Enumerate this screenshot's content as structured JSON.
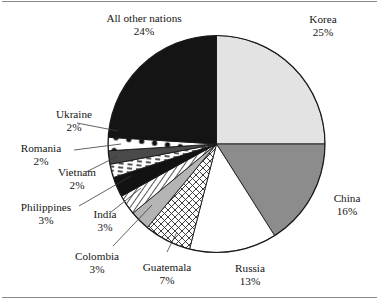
{
  "figure": {
    "name": "pie-chart-immigration-by-country",
    "background": "#ffffff",
    "frame_color": "#8a8a8a",
    "text_color": "#151515"
  },
  "chart_data": {
    "type": "pie",
    "title": "",
    "subtitle": "",
    "xlabel": "",
    "ylabel": "",
    "legend_position": "none",
    "grid": false,
    "total_percent": 100,
    "start_angle_deg": 0,
    "direction": "clockwise",
    "categories": [
      "Korea",
      "China",
      "Russia",
      "Guatemala",
      "Colombia",
      "India",
      "Philippines",
      "Vietnam",
      "Romania",
      "Ukraine",
      "All other nations"
    ],
    "values": [
      25,
      16,
      13,
      7,
      3,
      3,
      3,
      2,
      2,
      2,
      24
    ],
    "labels": [
      "Korea 25%",
      "China 16%",
      "Russia 13%",
      "Guatemala 7%",
      "Colombia 3%",
      "India 3%",
      "Philippines 3%",
      "Vietnam 2%",
      "Romania 2%",
      "Ukraine 2%",
      "All other nations 24%"
    ],
    "slices": [
      {
        "name": "Korea",
        "percent": 25,
        "label": "Korea",
        "percent_text": "25%",
        "fill": "#e3e3e3",
        "pattern": "solid-light-gray"
      },
      {
        "name": "China",
        "percent": 16,
        "label": "China",
        "percent_text": "16%",
        "fill": "#8c8c8c",
        "pattern": "solid-medium-gray"
      },
      {
        "name": "Russia",
        "percent": 13,
        "label": "Russia",
        "percent_text": "13%",
        "fill": "#ffffff",
        "pattern": "solid-white"
      },
      {
        "name": "Guatemala",
        "percent": 7,
        "label": "Guatemala",
        "percent_text": "7%",
        "fill": "#ffffff",
        "pattern": "crosshatch"
      },
      {
        "name": "Colombia",
        "percent": 3,
        "label": "Colombia",
        "percent_text": "3%",
        "fill": "#b4b4b4",
        "pattern": "solid-gray"
      },
      {
        "name": "India",
        "percent": 3,
        "label": "India",
        "percent_text": "3%",
        "fill": "#ffffff",
        "pattern": "diagonal-lines"
      },
      {
        "name": "Philippines",
        "percent": 3,
        "label": "Philippines",
        "percent_text": "3%",
        "fill": "#121212",
        "pattern": "solid-black"
      },
      {
        "name": "Vietnam",
        "percent": 2,
        "label": "Vietnam",
        "percent_text": "2%",
        "fill": "#ffffff",
        "pattern": "dashed-lines"
      },
      {
        "name": "Romania",
        "percent": 2,
        "label": "Romania",
        "percent_text": "2%",
        "fill": "#4a4a4a",
        "pattern": "solid-dark-gray"
      },
      {
        "name": "Ukraine",
        "percent": 2,
        "label": "Ukraine",
        "percent_text": "2%",
        "fill": "#ffffff",
        "pattern": "white-with-black-dots"
      },
      {
        "name": "All other nations",
        "percent": 24,
        "label": "All other nations",
        "percent_text": "24%",
        "fill": "#141414",
        "pattern": "solid-black"
      }
    ]
  },
  "labels": {
    "all_other_nations": {
      "name": "All other nations",
      "percent": "24%"
    },
    "korea": {
      "name": "Korea",
      "percent": "25%"
    },
    "china": {
      "name": "China",
      "percent": "16%"
    },
    "russia": {
      "name": "Russia",
      "percent": "13%"
    },
    "guatemala": {
      "name": "Guatemala",
      "percent": "7%"
    },
    "colombia": {
      "name": "Colombia",
      "percent": "3%"
    },
    "india": {
      "name": "India",
      "percent": "3%"
    },
    "philippines": {
      "name": "Philippines",
      "percent": "3%"
    },
    "vietnam": {
      "name": "Vietnam",
      "percent": "2%"
    },
    "romania": {
      "name": "Romania",
      "percent": "2%"
    },
    "ukraine": {
      "name": "Ukraine",
      "percent": "2%"
    }
  }
}
